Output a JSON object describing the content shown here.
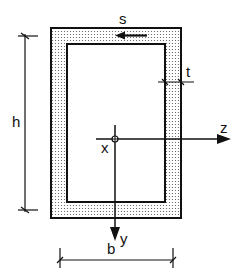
{
  "diagram": {
    "labels": {
      "s": "s",
      "t": "t",
      "h": "h",
      "b": "b",
      "x": "x",
      "y": "y",
      "z": "z"
    },
    "colors": {
      "stroke": "#111111",
      "fill_dots": "#555555",
      "background": "#ffffff"
    },
    "section": {
      "outer": {
        "x": 51,
        "y": 28,
        "width": 130,
        "height": 190
      },
      "inner": {
        "x": 67,
        "y": 44,
        "width": 98,
        "height": 158
      }
    },
    "origin": {
      "x": 115,
      "y": 139
    },
    "elements": [
      "s flow-direction arrow (pointing left along top flange)",
      "t wall thickness dimension",
      "h height dimension",
      "b width dimension",
      "z axis (horizontal, right)",
      "y axis (vertical, down)",
      "x axis (out of plane, centroid marker)"
    ]
  }
}
